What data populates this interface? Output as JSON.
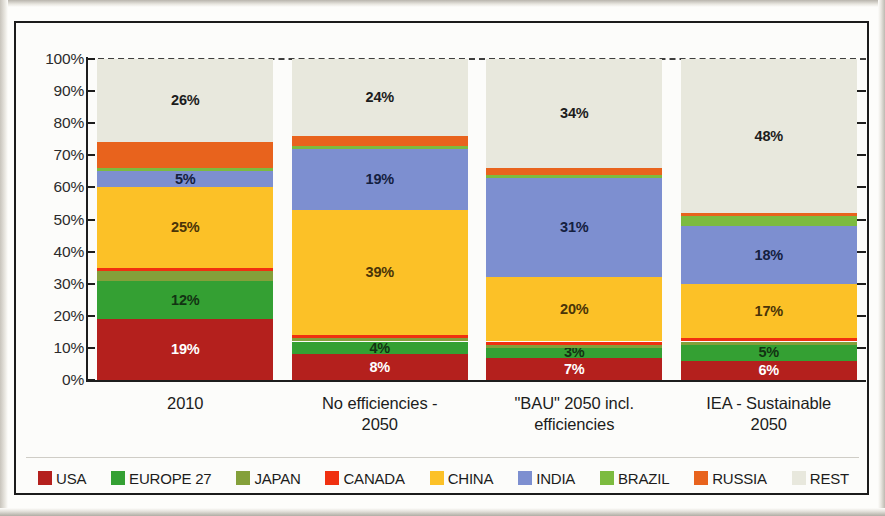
{
  "chart_data": {
    "type": "bar",
    "subtype": "100% stacked column",
    "title": "",
    "xlabel": "",
    "ylabel": "",
    "ylim": [
      0,
      100
    ],
    "ytick_labels": [
      "100%",
      "90%",
      "80%",
      "70%",
      "60%",
      "50%",
      "40%",
      "30%",
      "20%",
      "10%",
      "0%"
    ],
    "ytick_values": [
      100,
      90,
      80,
      70,
      60,
      50,
      40,
      30,
      20,
      10,
      0
    ],
    "grid": true,
    "grid_style": "dashed horizontal",
    "legend_position": "bottom",
    "categories": [
      "2010",
      "No efficiencies - 2050",
      "\"BAU\" 2050 incl. efficiencies",
      "IEA - Sustainable 2050"
    ],
    "category_lines": [
      [
        "2010"
      ],
      [
        "No efficiencies -",
        "2050"
      ],
      [
        "\"BAU\" 2050 incl.",
        "efficiencies"
      ],
      [
        "IEA - Sustainable",
        "2050"
      ]
    ],
    "series": [
      {
        "name": "USA",
        "color": "#b4201d",
        "label_color": "#ffffff",
        "values": [
          19,
          8,
          7,
          6
        ],
        "shown_labels": [
          "19%",
          "8%",
          "7%",
          "6%"
        ]
      },
      {
        "name": "EUROPE 27",
        "color": "#34a033",
        "label_color": "#123312",
        "values": [
          12,
          4,
          3,
          5
        ],
        "shown_labels": [
          "12%",
          "4%",
          "3%",
          "5%"
        ]
      },
      {
        "name": "JAPAN",
        "color": "#84a03a",
        "label_color": "#1c1c1c",
        "values": [
          3,
          1,
          1,
          1
        ],
        "shown_labels": [
          "",
          "",
          "",
          ""
        ]
      },
      {
        "name": "CANADA",
        "color": "#f03010",
        "label_color": "#ffffff",
        "values": [
          1,
          1,
          1,
          1
        ],
        "shown_labels": [
          "",
          "",
          "",
          ""
        ]
      },
      {
        "name": "CHINA",
        "color": "#fcc127",
        "label_color": "#4a3408",
        "values": [
          25,
          39,
          20,
          17
        ],
        "shown_labels": [
          "25%",
          "39%",
          "20%",
          "17%"
        ]
      },
      {
        "name": "INDIA",
        "color": "#7d8fd0",
        "label_color": "#14203f",
        "values": [
          5,
          19,
          31,
          18
        ],
        "shown_labels": [
          "5%",
          "19%",
          "31%",
          "18%"
        ]
      },
      {
        "name": "BRAZIL",
        "color": "#7cbb3f",
        "label_color": "#1c1c1c",
        "values": [
          1,
          1,
          1,
          3
        ],
        "shown_labels": [
          "",
          "",
          "",
          ""
        ]
      },
      {
        "name": "RUSSIA",
        "color": "#e8631d",
        "label_color": "#ffffff",
        "values": [
          8,
          3,
          2,
          1
        ],
        "shown_labels": [
          "",
          "",
          "",
          ""
        ]
      },
      {
        "name": "REST",
        "color": "#e8e8dd",
        "label_color": "#1c1c1c",
        "values": [
          26,
          24,
          34,
          48
        ],
        "shown_labels": [
          "26%",
          "24%",
          "34%",
          "48%"
        ]
      }
    ]
  }
}
